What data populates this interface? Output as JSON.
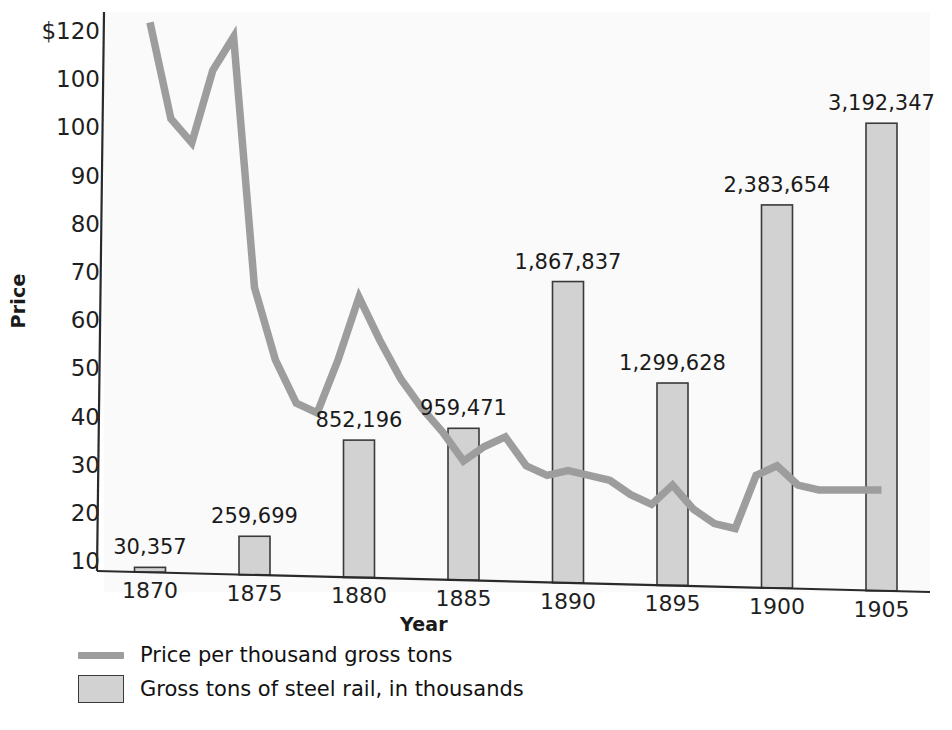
{
  "chart_data": {
    "type": "bar",
    "title": "",
    "subtitle": "",
    "xlabel": "Year",
    "ylabel": "Price",
    "categories": [
      "1870",
      "1875",
      "1880",
      "1885",
      "1890",
      "1895",
      "1900",
      "1905"
    ],
    "ylim": [
      0,
      120
    ],
    "y_ticks": [
      "$120",
      "100",
      "100",
      "90",
      "80",
      "70",
      "60",
      "50",
      "40",
      "30",
      "20",
      "10"
    ],
    "y_tick_values": [
      120,
      110,
      100,
      90,
      80,
      70,
      60,
      50,
      40,
      30,
      20,
      10
    ],
    "grid": false,
    "legend_position": "below-left",
    "series": [
      {
        "name": "Gross tons of steel rail, in thousands",
        "type": "bar",
        "color": "#d2d2d2",
        "edge_color": "#3a3a3a",
        "categories": [
          "1870",
          "1875",
          "1880",
          "1885",
          "1890",
          "1895",
          "1900",
          "1905"
        ],
        "values": [
          30357,
          259699,
          852196,
          959471,
          1867837,
          1299628,
          2383654,
          3192347
        ],
        "labels": [
          "30,357",
          "259,699",
          "852,196",
          "959,471",
          "1,867,837",
          "1,299,628",
          "2,383,654",
          "3,192,347"
        ],
        "plotted_heights_price_scale": [
          1,
          8,
          28.5,
          31.5,
          62.5,
          42,
          79.5,
          97
        ]
      },
      {
        "name": "Price per thousand gross tons",
        "type": "line",
        "color": "#9d9d9d",
        "x": [
          1870,
          1871,
          1872,
          1873,
          1874,
          1875,
          1876,
          1877,
          1878,
          1879,
          1880,
          1881,
          1882,
          1883,
          1884,
          1885,
          1886,
          1887,
          1888,
          1889,
          1890,
          1891,
          1892,
          1893,
          1894,
          1895,
          1896,
          1897,
          1898,
          1899,
          1900,
          1901,
          1902,
          1903,
          1904,
          1905
        ],
        "values": [
          123,
          102,
          97,
          112,
          119,
          67,
          52,
          43,
          41,
          52,
          65,
          56,
          48,
          42,
          37,
          31,
          34,
          36,
          30,
          28,
          29,
          28,
          27,
          24,
          22,
          26,
          21,
          18,
          17,
          28,
          30,
          26,
          25,
          25,
          25,
          25
        ],
        "plotted_values": [
          122,
          102,
          97,
          112,
          119,
          67,
          52,
          43,
          41,
          52,
          65,
          56,
          48,
          42,
          37,
          31,
          34,
          36,
          30,
          28,
          29,
          28,
          27,
          24,
          22,
          26,
          21,
          18,
          17,
          28,
          30,
          26,
          25,
          25,
          25,
          25
        ]
      }
    ]
  },
  "axes": {
    "y_title": "Price",
    "x_title": "Year"
  },
  "legend": {
    "items": [
      {
        "label": "Price per thousand gross tons",
        "marker": "line-swatch"
      },
      {
        "label": "Gross tons of steel rail, in thousands",
        "marker": "box-swatch"
      }
    ]
  },
  "colors": {
    "bar_fill": "#d2d2d2",
    "bar_edge": "#3a3a3a",
    "line": "#9d9d9d",
    "axis": "#2a2a2a",
    "text": "#1a1a1a",
    "background": "#ffffff"
  }
}
